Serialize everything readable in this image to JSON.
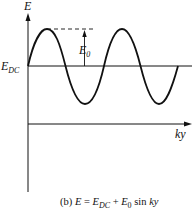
{
  "diagram": {
    "y_axis_label": "E",
    "x_axis_label": "ky",
    "dc_level_label": "E",
    "dc_level_sub": "DC",
    "amplitude_label": "E",
    "amplitude_sub": "0",
    "caption_prefix": "(b) ",
    "caption_lhs": "E",
    "caption_eq": " = ",
    "caption_e1": "E",
    "caption_e1_sub": "DC",
    "caption_plus": " + ",
    "caption_e2": "E",
    "caption_e2_sub": "0",
    "caption_sin": " sin ",
    "caption_arg": "ky"
  }
}
